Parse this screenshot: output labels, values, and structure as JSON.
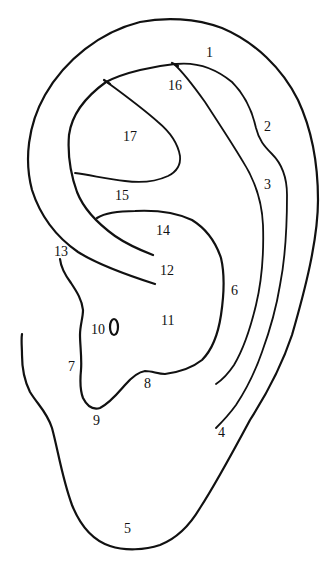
{
  "diagram": {
    "line_color": "#111111",
    "background": "#ffffff",
    "labels": [
      {
        "id": "1",
        "text": "1",
        "x": 206,
        "y": 57
      },
      {
        "id": "16",
        "text": "16",
        "x": 168,
        "y": 90
      },
      {
        "id": "2",
        "text": "2",
        "x": 264,
        "y": 131
      },
      {
        "id": "17",
        "text": "17",
        "x": 123,
        "y": 141
      },
      {
        "id": "3",
        "text": "3",
        "x": 264,
        "y": 189
      },
      {
        "id": "15",
        "text": "15",
        "x": 115,
        "y": 200
      },
      {
        "id": "14",
        "text": "14",
        "x": 156,
        "y": 235
      },
      {
        "id": "13",
        "text": "13",
        "x": 54,
        "y": 256
      },
      {
        "id": "12",
        "text": "12",
        "x": 160,
        "y": 275
      },
      {
        "id": "6",
        "text": "6",
        "x": 231,
        "y": 295
      },
      {
        "id": "11",
        "text": "11",
        "x": 161,
        "y": 325
      },
      {
        "id": "10",
        "text": "10",
        "x": 91,
        "y": 334
      },
      {
        "id": "7",
        "text": "7",
        "x": 68,
        "y": 371
      },
      {
        "id": "8",
        "text": "8",
        "x": 144,
        "y": 388
      },
      {
        "id": "9",
        "text": "9",
        "x": 93,
        "y": 425
      },
      {
        "id": "4",
        "text": "4",
        "x": 218,
        "y": 437
      },
      {
        "id": "5",
        "text": "5",
        "x": 124,
        "y": 533
      }
    ]
  }
}
